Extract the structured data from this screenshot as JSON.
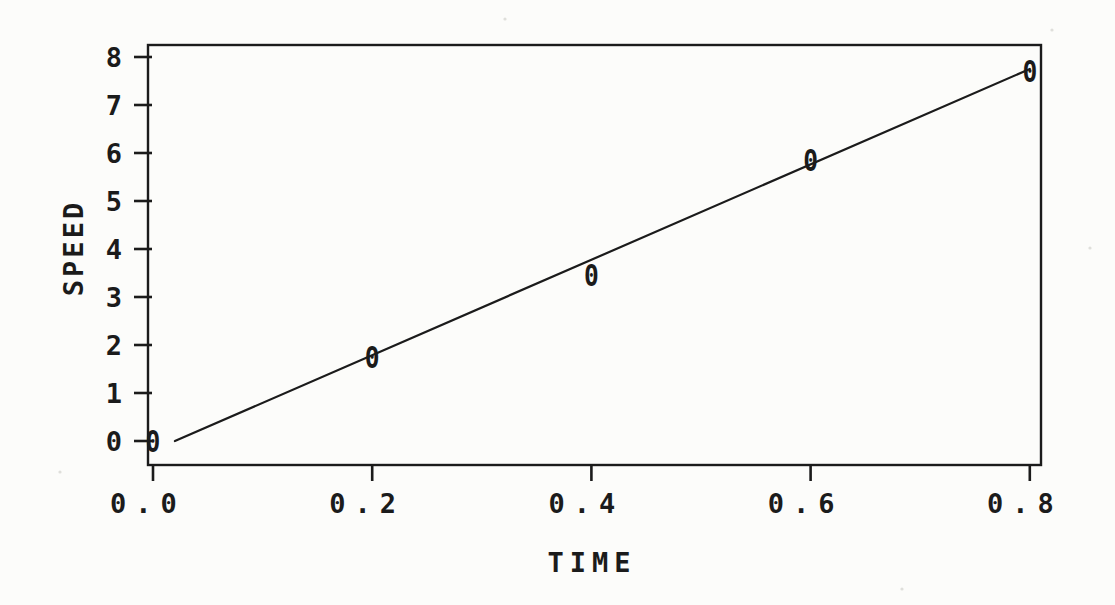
{
  "chart_data": {
    "type": "scatter",
    "title": "",
    "xlabel": "TIME",
    "ylabel": "SPEED",
    "marker_glyph": "0",
    "series": [
      {
        "name": "measured-points",
        "points": [
          {
            "x": 0.0,
            "y": 0.0
          },
          {
            "x": 0.2,
            "y": 1.75
          },
          {
            "x": 0.4,
            "y": 3.45
          },
          {
            "x": 0.6,
            "y": 5.85
          },
          {
            "x": 0.8,
            "y": 7.7
          }
        ]
      },
      {
        "name": "fit-line",
        "type": "line",
        "from": {
          "x": 0.02,
          "y": 0.0
        },
        "to": {
          "x": 0.8,
          "y": 7.75
        }
      }
    ],
    "xticks": {
      "values": [
        0.0,
        0.2,
        0.4,
        0.6,
        0.8
      ],
      "labels": [
        "0.0",
        "0.2",
        "0.4",
        "0.6",
        "0.8"
      ]
    },
    "yticks": {
      "values": [
        0,
        1,
        2,
        3,
        4,
        5,
        6,
        7,
        8
      ],
      "labels": [
        "0",
        "1",
        "2",
        "3",
        "4",
        "5",
        "6",
        "7",
        "8"
      ]
    },
    "xlim": [
      0.0,
      0.8
    ],
    "ylim": [
      0,
      8
    ],
    "grid": false,
    "legend": null,
    "ink_color": "#1b1b1b",
    "paper_color": "#fcfcfa"
  }
}
